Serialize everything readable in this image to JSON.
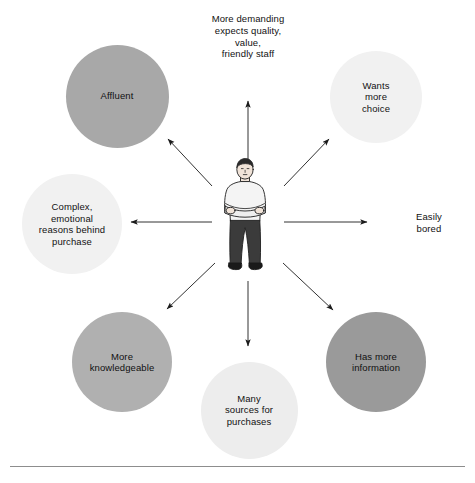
{
  "diagram": {
    "center": {
      "figure_name": "standing-man-arms-crossed",
      "shirt_color": "#f2f2f2",
      "trouser_color": "#3b3b3b",
      "hair_color": "#2b2b2b",
      "skin_color": "#f0e3d8"
    },
    "top_caption": {
      "lines": [
        "More demanding",
        "expects quality,",
        "value,",
        "friendly staff"
      ]
    },
    "nodes": [
      {
        "id": "affluent",
        "lines": [
          "Affluent"
        ],
        "fill": "#a8a8a8",
        "shape": "circle",
        "diameter": 103,
        "cx": 117,
        "cy": 96
      },
      {
        "id": "wants-more-choice",
        "lines": [
          "Wants",
          "more",
          "choice"
        ],
        "fill": "#f1f1f1",
        "shape": "circle",
        "diameter": 92,
        "cx": 376,
        "cy": 97
      },
      {
        "id": "complex-emotional-reasons",
        "lines": [
          "Complex,",
          "emotional",
          "reasons behind",
          "purchase"
        ],
        "fill": "#f1f1f1",
        "shape": "circle",
        "diameter": 100,
        "cx": 72,
        "cy": 224
      },
      {
        "id": "easily-bored",
        "lines": [
          "Easily",
          "bored"
        ],
        "fill": "none",
        "shape": "text-only",
        "cx": 429,
        "cy": 224
      },
      {
        "id": "more-knowledgeable",
        "lines": [
          "More",
          "knowledgeable"
        ],
        "fill": "#b0b0b0",
        "shape": "circle",
        "diameter": 100,
        "cx": 122,
        "cy": 362
      },
      {
        "id": "has-more-information",
        "lines": [
          "Has more",
          "information"
        ],
        "fill": "#9a9a9a",
        "shape": "circle",
        "diameter": 100,
        "cx": 376,
        "cy": 362
      },
      {
        "id": "many-sources-for-purchases",
        "lines": [
          "Many",
          "sources for",
          "purchases"
        ],
        "fill": "#ededed",
        "shape": "circle",
        "diameter": 97,
        "cx": 249,
        "cy": 410
      }
    ],
    "arrows": [
      {
        "id": "arrow-up",
        "from": [
          248,
          200
        ],
        "to": [
          248,
          100
        ],
        "head": "to"
      },
      {
        "id": "arrow-up-left",
        "from": [
          212,
          186
        ],
        "to": [
          167,
          138
        ],
        "head": "to"
      },
      {
        "id": "arrow-up-right",
        "from": [
          284,
          186
        ],
        "to": [
          330,
          138
        ],
        "head": "to"
      },
      {
        "id": "arrow-left",
        "from": [
          212,
          222
        ],
        "to": [
          130,
          222
        ],
        "head": "to"
      },
      {
        "id": "arrow-right",
        "from": [
          284,
          222
        ],
        "to": [
          368,
          222
        ],
        "head": "to"
      },
      {
        "id": "arrow-down-left",
        "from": [
          215,
          263
        ],
        "to": [
          166,
          310
        ],
        "head": "to"
      },
      {
        "id": "arrow-down-right",
        "from": [
          283,
          263
        ],
        "to": [
          334,
          311
        ],
        "head": "to"
      },
      {
        "id": "arrow-down",
        "from": [
          248,
          280
        ],
        "to": [
          248,
          347
        ],
        "head": "to"
      }
    ],
    "stroke_color": "#1b1b1b",
    "rule_color": "#8d8d8d"
  }
}
